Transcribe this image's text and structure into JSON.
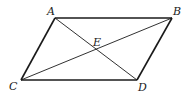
{
  "diagram": {
    "type": "parallelogram with diagonals",
    "stroke_color": "#1a1a1a",
    "points": {
      "A": {
        "label": "A",
        "x": 55,
        "y": 18
      },
      "B": {
        "label": "B",
        "x": 172,
        "y": 18
      },
      "C": {
        "label": "C",
        "x": 21,
        "y": 80
      },
      "D": {
        "label": "D",
        "x": 137,
        "y": 80
      },
      "E": {
        "label": "E",
        "x": 96,
        "y": 49
      }
    },
    "edges": [
      "AB",
      "BD",
      "DC",
      "CA"
    ],
    "diagonals": [
      "AD",
      "CB"
    ],
    "labels": {
      "A": "A",
      "B": "B",
      "C": "C",
      "D": "D",
      "E": "E"
    }
  }
}
